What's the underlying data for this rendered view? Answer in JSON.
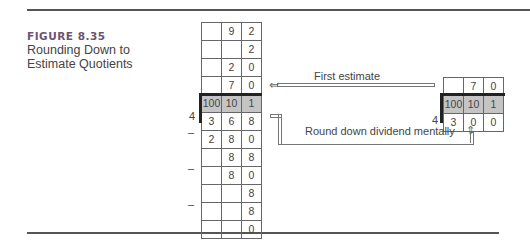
{
  "figure": {
    "label": "FIGURE 8.35",
    "title": "Rounding Down to Estimate Quotients"
  },
  "left_problem": {
    "divisor": "4",
    "rows": [
      [
        "",
        "9",
        "2"
      ],
      [
        "",
        "",
        "2"
      ],
      [
        "",
        "2",
        "0"
      ],
      [
        "",
        "7",
        "0"
      ],
      [
        "100",
        "10",
        "1"
      ],
      [
        "3",
        "6",
        "8"
      ],
      [
        "2",
        "8",
        "0"
      ],
      [
        "",
        "8",
        "8"
      ],
      [
        "",
        "8",
        "0"
      ],
      [
        "",
        "",
        "8"
      ],
      [
        "",
        "",
        "8"
      ],
      [
        "",
        "",
        "0"
      ]
    ],
    "minus_sign": "–"
  },
  "right_problem": {
    "divisor": "4",
    "rows": [
      [
        "",
        "7",
        "0"
      ],
      [
        "100",
        "10",
        "1"
      ],
      [
        "3",
        "0",
        "0"
      ]
    ]
  },
  "annotations": {
    "first_estimate": "First estimate",
    "round_down": "Round down dividend mentally"
  }
}
